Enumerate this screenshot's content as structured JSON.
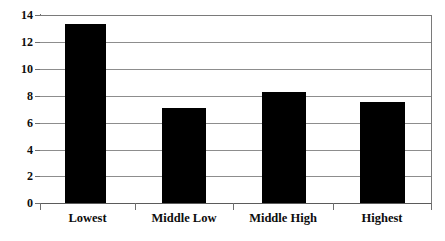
{
  "chart_data": {
    "type": "bar",
    "title": "",
    "subtitle": "",
    "xlabel": "",
    "ylabel": "",
    "categories": [
      "Lowest",
      "Middle Low",
      "Middle High",
      "Highest"
    ],
    "values": [
      13.3,
      7.1,
      8.25,
      7.5
    ],
    "series": [
      {
        "name": "",
        "values": [
          13.3,
          7.1,
          8.25,
          7.5
        ],
        "color": "#000000"
      }
    ],
    "ylim": [
      0,
      14
    ],
    "y_ticks": [
      0,
      2,
      4,
      6,
      8,
      10,
      12,
      14
    ],
    "y_tick_labels": [
      "0",
      "2",
      "4",
      "6",
      "8",
      "10",
      "12",
      "14"
    ],
    "grid": "horizontal",
    "legend": "none",
    "bar_color": "#000000",
    "grid_color": "#8d8d8d",
    "axis_color": "#6f6f6f",
    "background": "#ffffff"
  }
}
